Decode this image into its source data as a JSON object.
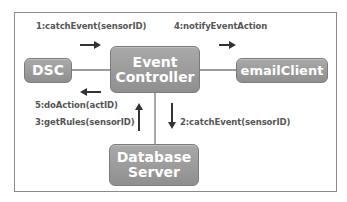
{
  "diagram": {
    "nodes": {
      "dsc": {
        "label": "DSC"
      },
      "event_controller": {
        "line1": "Event",
        "line2": "Controller"
      },
      "email_client": {
        "label": "emailClient"
      },
      "database_server": {
        "line1": "Database",
        "line2": "Server"
      }
    },
    "messages": {
      "m1": "1:catchEvent(sensorID)",
      "m2": "2:catchEvent(sensorID)",
      "m3": "3:getRules(sensorID)",
      "m4": "4:notifyEventAction",
      "m5": "5:doAction(actID)"
    },
    "colors": {
      "box_fill": "#9c9c9c",
      "box_text": "#ffffff",
      "label_text": "#555555",
      "line": "#6e6e6e",
      "arrow": "#333333"
    }
  }
}
